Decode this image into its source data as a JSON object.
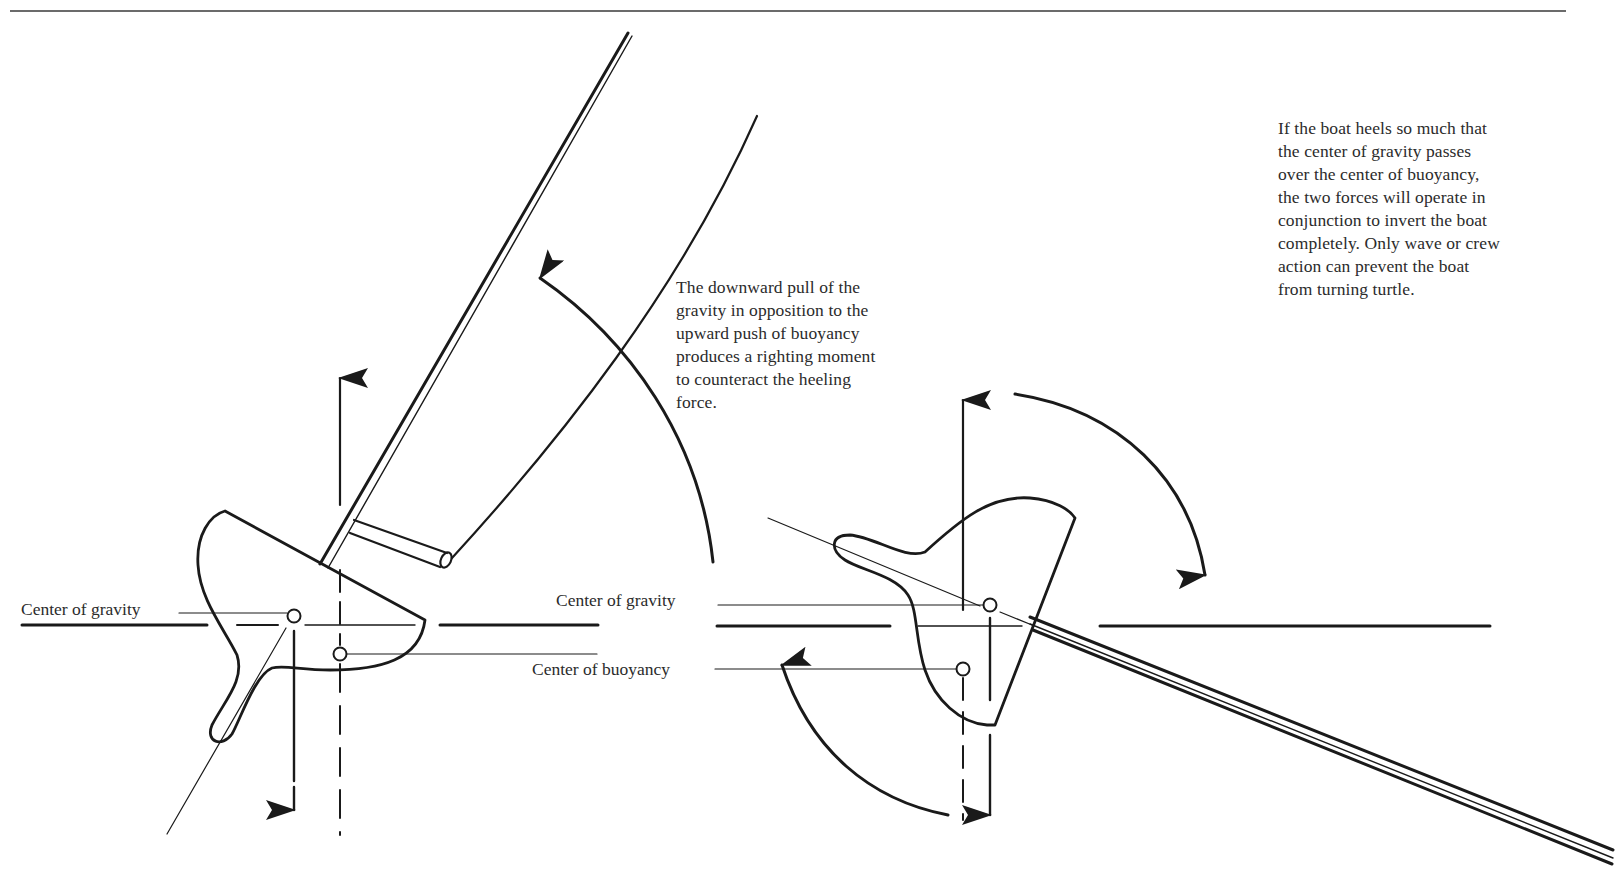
{
  "diagram": {
    "captions": {
      "righting_moment": "The downward pull of the\ngravity in opposition to the\nupward push of buoyancy\nproduces a righting moment\nto counteract the heeling\nforce.",
      "capsize": "If the boat heels so much that\nthe center of gravity passes\nover the center of buoyancy,\nthe two forces will operate in\nconjunction to invert the boat\ncompletely. Only wave or crew\naction can prevent the boat\nfrom turning turtle."
    },
    "labels": {
      "left_center_of_gravity": "Center of gravity",
      "mid_center_of_gravity": "Center of gravity",
      "mid_center_of_buoyancy": "Center of buoyancy"
    },
    "figures": [
      {
        "id": "heeled-boat-righting",
        "description": "Boat heeled to starboard; gravity acts down through CG, buoyancy acts up through CB, producing a counterclockwise righting moment",
        "forces": [
          "gravity-down-arrow",
          "buoyancy-up-arrow",
          "righting-moment-arc-arrow"
        ]
      },
      {
        "id": "boat-past-capsize-point",
        "description": "Boat heeled past horizontal; CG has passed over CB, forces act together to invert the boat",
        "forces": [
          "gravity-down-arrow",
          "buoyancy-up-arrow",
          "capsize-arc-arrow-clockwise",
          "counter-arc-arrow"
        ]
      }
    ],
    "colors": {
      "ink": "#1a1a1a",
      "text": "#2b2b2b",
      "background": "#ffffff"
    }
  }
}
